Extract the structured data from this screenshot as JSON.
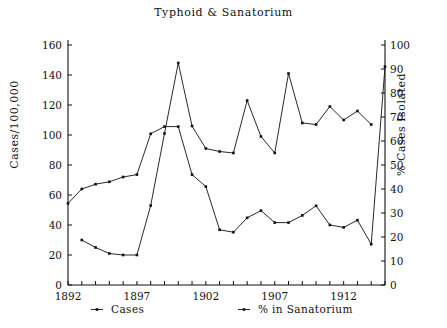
{
  "chart_data": {
    "type": "line",
    "title": "Typhoid & Sanatorium",
    "xlabel": "",
    "ylabel": "Cases/100,000",
    "ylabel_right": "% Cases Isolated",
    "x": [
      1892,
      1893,
      1894,
      1895,
      1896,
      1897,
      1898,
      1899,
      1900,
      1901,
      1902,
      1903,
      1904,
      1905,
      1906,
      1907,
      1908,
      1909,
      1910,
      1911,
      1912,
      1913,
      1914,
      1915
    ],
    "xlim": [
      1892,
      1915
    ],
    "ylim": [
      0,
      160
    ],
    "ylim_right": [
      0,
      100
    ],
    "xticks": [
      1892,
      1893,
      1894,
      1895,
      1896,
      1897,
      1898,
      1899,
      1900,
      1901,
      1902,
      1903,
      1904,
      1905,
      1906,
      1907,
      1908,
      1909,
      1910,
      1911,
      1912,
      1913,
      1914,
      1915
    ],
    "xticklabels_shown": [
      "1892",
      "1897",
      "1902",
      "1907",
      "1912"
    ],
    "xticklabel_years": [
      1892,
      1897,
      1902,
      1907,
      1912
    ],
    "yticks": [
      0,
      20,
      40,
      60,
      80,
      100,
      120,
      140,
      160
    ],
    "yticklabels": [
      "0",
      "20",
      "40",
      "60",
      "80",
      "100",
      "120",
      "140",
      "160"
    ],
    "yticks_right": [
      0,
      10,
      20,
      30,
      40,
      50,
      60,
      70,
      80,
      90,
      100
    ],
    "yticklabels_right": [
      "0",
      "10",
      "20",
      "30",
      "40",
      "50",
      "60",
      "70",
      "80",
      "90",
      "100"
    ],
    "grid": false,
    "legend_position": "below-axis",
    "series": [
      {
        "name": "Cases",
        "axis": "left",
        "marker": "square-dot",
        "values": [
          null,
          30,
          25,
          21,
          20,
          20,
          53,
          101,
          148,
          106,
          91,
          89,
          88,
          123,
          99,
          88,
          141,
          108,
          107,
          119,
          110,
          116,
          107,
          null
        ]
      },
      {
        "name": "% in Sanatorium",
        "axis": "right",
        "marker": "square-dot",
        "values": [
          34,
          40,
          42,
          43,
          45,
          46,
          63,
          66,
          66,
          46,
          41,
          23,
          22,
          28,
          31,
          26,
          26,
          29,
          33,
          25,
          24,
          27,
          17,
          91
        ]
      }
    ]
  },
  "legend": {
    "items": [
      {
        "label": "Cases",
        "marker": "dot-line"
      },
      {
        "label": "% in Sanatorium",
        "marker": "dot-line"
      }
    ]
  },
  "axes": {
    "left_title": "Cases/100,000",
    "right_title": "% Cases Isolated"
  }
}
